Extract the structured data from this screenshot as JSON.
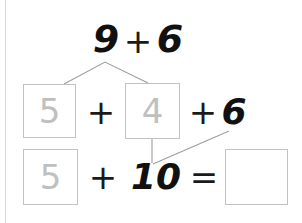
{
  "worksheet": {
    "type": "make-a-ten number bond",
    "background_color": "#ffffff",
    "ink_color": "#111111",
    "box_border_color": "#c2c2c2",
    "faint_digit_color": "#bfbfbf",
    "connector_color": "#9e9e9e",
    "margin_rule_color": "#d9d9d9"
  },
  "expression_row": {
    "first_addend": "9",
    "plus_sign": "+",
    "second_addend": "6"
  },
  "decomposition_row": {
    "box_left_value": "5",
    "plus_sign_1": "+",
    "box_right_value": "4",
    "plus_sign_2": "+",
    "trailing_addend": "6"
  },
  "sum_row": {
    "box_left_value": "5",
    "plus_sign": "+",
    "ten_value": "10",
    "equals_sign": "=",
    "answer_box_value": ""
  },
  "connectors": {
    "bond_apex": "number-bond from 9 to 5 and 4",
    "regroup": "line from 6 down to the 10"
  }
}
